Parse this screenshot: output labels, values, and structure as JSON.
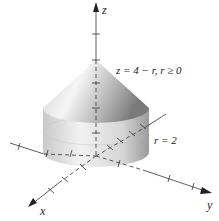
{
  "figure": {
    "axes": {
      "x": "x",
      "y": "y",
      "z": "z"
    },
    "cone_equation": "z = 4 − r,   r ≥ 0",
    "cylinder_equation": "r = 2"
  }
}
